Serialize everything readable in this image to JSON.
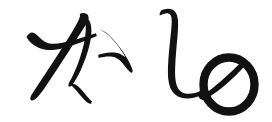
{
  "image": {
    "kind": "handwriting-sample",
    "background_color": "#ffffff",
    "ink_color": "#111111",
    "width": 272,
    "height": 122,
    "transcription": "かしの",
    "romaji": "kashino",
    "script": "hiragana",
    "alt_text": "Handwritten Japanese hiragana reading kashino"
  },
  "glyphs": [
    {
      "id": "glyph-ka",
      "char": "か",
      "romaji": "ka",
      "order": 1,
      "stroke_count": 3,
      "box": {
        "x": 25,
        "y": 12,
        "width": 112,
        "height": 90
      },
      "ink_color": "#111111"
    },
    {
      "id": "glyph-shi",
      "char": "し",
      "romaji": "shi",
      "order": 2,
      "stroke_count": 1,
      "box": {
        "x": 160,
        "y": 8,
        "width": 46,
        "height": 92
      },
      "ink_color": "#111111"
    },
    {
      "id": "glyph-no",
      "char": "の",
      "romaji": "no",
      "order": 3,
      "stroke_count": 1,
      "box": {
        "x": 201,
        "y": 56,
        "width": 56,
        "height": 57
      },
      "ink_color": "#111111"
    }
  ]
}
